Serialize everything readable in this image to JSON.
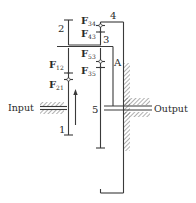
{
  "diagram": {
    "type": "planetary gear train force diagram",
    "labels": {
      "gear_2": "2",
      "gear_3": "3",
      "gear_4": "4",
      "gear_1": "1",
      "gear_5": "5",
      "arm": "A",
      "input": "Input",
      "output": "Output"
    },
    "forces": [
      {
        "main": "F",
        "sub": "34"
      },
      {
        "main": "F",
        "sub": "43"
      },
      {
        "main": "F",
        "sub": "53"
      },
      {
        "main": "F",
        "sub": "35"
      },
      {
        "main": "F",
        "sub": "12"
      },
      {
        "main": "F",
        "sub": "21"
      }
    ],
    "colors": {
      "line": "#3a3a3a",
      "text": "#2a2a2a",
      "background": "#ffffff"
    }
  }
}
